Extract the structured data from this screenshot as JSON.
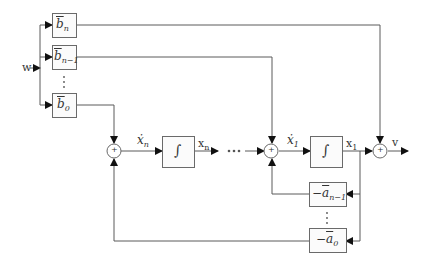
{
  "diagram": {
    "type": "block-diagram",
    "input_label": "w",
    "output_label": "v",
    "gain_blocks_b": [
      {
        "id": "bn",
        "symbol": "b",
        "subscript": "n"
      },
      {
        "id": "bn1",
        "symbol": "b",
        "subscript": "n−1"
      },
      {
        "id": "b0",
        "symbol": "b",
        "subscript": "0"
      }
    ],
    "gain_blocks_a": [
      {
        "id": "an1",
        "prefix": "−",
        "symbol": "a",
        "subscript": "n−1"
      },
      {
        "id": "a0",
        "prefix": "−",
        "symbol": "a",
        "subscript": "0"
      }
    ],
    "integrators": [
      {
        "id": "int_n",
        "symbol": "∫",
        "input_label": "ẋ",
        "input_sub": "n",
        "output_label": "x",
        "output_sub": "n"
      },
      {
        "id": "int_1",
        "symbol": "∫",
        "input_label": "ẋ",
        "input_sub": "1",
        "output_label": "x",
        "output_sub": "1"
      }
    ],
    "summing_junctions": [
      {
        "id": "sum_n",
        "symbol": "+"
      },
      {
        "id": "sum_1",
        "symbol": "+"
      },
      {
        "id": "sum_out",
        "symbol": "+"
      }
    ],
    "ellipsis_horizontal": "···",
    "ellipsis_vertical": "⋮",
    "colors": {
      "line": "#5a5a5a",
      "box_border": "#6a6a6a",
      "box_fill": "#fbfbfb",
      "text": "#333333"
    }
  }
}
